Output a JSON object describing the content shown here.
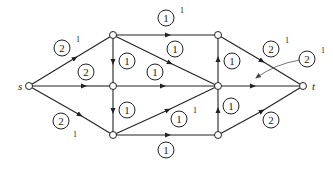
{
  "diagram": {
    "type": "flow-network",
    "nodes": [
      {
        "id": "s",
        "label": "s",
        "x": 29,
        "y": 86
      },
      {
        "id": "A",
        "label": "",
        "x": 113,
        "y": 35
      },
      {
        "id": "B",
        "label": "",
        "x": 113,
        "y": 86
      },
      {
        "id": "C",
        "label": "",
        "x": 113,
        "y": 135
      },
      {
        "id": "D",
        "label": "",
        "x": 218,
        "y": 35
      },
      {
        "id": "E",
        "label": "",
        "x": 218,
        "y": 86
      },
      {
        "id": "F",
        "label": "",
        "x": 218,
        "y": 135
      },
      {
        "id": "t",
        "label": "t",
        "x": 303,
        "y": 86
      }
    ],
    "edges": [
      {
        "from": "s",
        "to": "A",
        "capacity": "2",
        "flow": "1"
      },
      {
        "from": "s",
        "to": "B",
        "capacity": "2",
        "flow": ""
      },
      {
        "from": "s",
        "to": "C",
        "capacity": "2",
        "flow": "1"
      },
      {
        "from": "A",
        "to": "D",
        "capacity": "1",
        "flow": "1"
      },
      {
        "from": "A",
        "to": "B",
        "capacity": "1",
        "flow": ""
      },
      {
        "from": "A",
        "to": "E",
        "capacity": "1",
        "flow": ""
      },
      {
        "from": "B",
        "to": "C",
        "capacity": "1",
        "flow": ""
      },
      {
        "from": "B",
        "to": "E",
        "capacity": "1",
        "flow": ""
      },
      {
        "from": "C",
        "to": "E",
        "capacity": "1",
        "flow": "1"
      },
      {
        "from": "C",
        "to": "F",
        "capacity": "1",
        "flow": ""
      },
      {
        "from": "F",
        "to": "E",
        "capacity": "1",
        "flow": ""
      },
      {
        "from": "E",
        "to": "D",
        "capacity": "1",
        "flow": ""
      },
      {
        "from": "D",
        "to": "t",
        "capacity": "2",
        "flow": "1"
      },
      {
        "from": "E",
        "to": "t",
        "capacity": "2",
        "flow": "1"
      },
      {
        "from": "F",
        "to": "t",
        "capacity": "2",
        "flow": ""
      }
    ],
    "labels": {
      "sA": {
        "cap": "2",
        "flow": "1"
      },
      "sB": {
        "cap": "2"
      },
      "sC": {
        "cap": "2",
        "flow": "1"
      },
      "AD": {
        "cap": "1",
        "flow": "1"
      },
      "AB": {
        "cap": "1"
      },
      "AE": {
        "cap": "1"
      },
      "BE": {
        "cap": "1"
      },
      "BC": {
        "cap": "1"
      },
      "CE": {
        "cap": "1",
        "flow": "1"
      },
      "CF": {
        "cap": "1"
      },
      "FE": {
        "cap": "1"
      },
      "ED": {
        "cap": "1"
      },
      "Dt": {
        "cap": "2",
        "flow": "1"
      },
      "Et": {
        "cap": "2",
        "flow": "1"
      },
      "Ft": {
        "cap": "2"
      }
    },
    "node_names": {
      "source": "s",
      "sink": "t"
    }
  }
}
